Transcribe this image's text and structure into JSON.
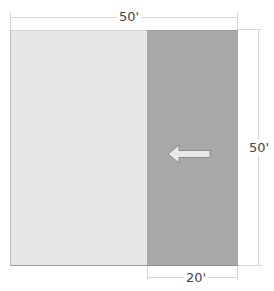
{
  "diagram": {
    "regions": [
      {
        "id": "main-area",
        "color": "#e6e6e6",
        "width_ft": 30
      },
      {
        "id": "shaded-area",
        "color": "#a8a8a8",
        "width_ft": 20
      }
    ],
    "dimensions": {
      "top": {
        "label": "50'"
      },
      "right": {
        "label": "50'"
      },
      "bottom": {
        "label": "20'"
      }
    },
    "arrow": {
      "direction": "left",
      "color": "#e8e8e8"
    }
  }
}
